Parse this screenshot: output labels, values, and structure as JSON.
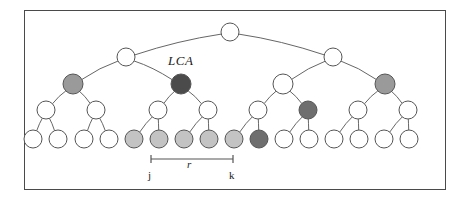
{
  "figure": {
    "frame": {
      "x": 24,
      "y": 10,
      "width": 422,
      "height": 180,
      "border_color": "#4a4a4a"
    }
  },
  "labels": {
    "lca": "LCA",
    "range": "r",
    "left_endpoint": "j",
    "right_endpoint": "k"
  },
  "colors": {
    "outline": "#555555",
    "edge": "#666666",
    "white_node": "#ffffff",
    "light_gray_node": "#c3c3c3",
    "medium_gray_node": "#9a9a9a",
    "dark_gray_node": "#6e6e6e",
    "darkest_node": "#4b4b4b",
    "bracket": "#555555",
    "background": "#ffffff"
  },
  "tree": {
    "levels": [
      {
        "depth": 0,
        "y": 32,
        "radius": 9,
        "nodes": [
          {
            "id": "root",
            "x": 230,
            "fill": "white_node",
            "label": ""
          }
        ]
      },
      {
        "depth": 1,
        "y": 57,
        "radius": 9,
        "nodes": [
          {
            "id": "d1-0",
            "x": 126,
            "fill": "white_node",
            "label": ""
          },
          {
            "id": "d1-1",
            "x": 333,
            "fill": "white_node",
            "label": ""
          }
        ]
      },
      {
        "depth": 2,
        "y": 84,
        "radius": 10,
        "nodes": [
          {
            "id": "d2-0",
            "x": 73,
            "fill": "medium_gray_node",
            "label": ""
          },
          {
            "id": "d2-1",
            "x": 181,
            "fill": "darkest_node",
            "label": "LCA"
          },
          {
            "id": "d2-2",
            "x": 283,
            "fill": "white_node",
            "label": ""
          },
          {
            "id": "d2-3",
            "x": 385,
            "fill": "medium_gray_node",
            "label": ""
          }
        ]
      },
      {
        "depth": 3,
        "y": 110,
        "radius": 9,
        "nodes": [
          {
            "id": "d3-0",
            "x": 46,
            "fill": "white_node",
            "label": ""
          },
          {
            "id": "d3-1",
            "x": 96,
            "fill": "white_node",
            "label": ""
          },
          {
            "id": "d3-2",
            "x": 158,
            "fill": "white_node",
            "label": ""
          },
          {
            "id": "d3-3",
            "x": 208,
            "fill": "white_node",
            "label": ""
          },
          {
            "id": "d3-4",
            "x": 258,
            "fill": "white_node",
            "label": ""
          },
          {
            "id": "d3-5",
            "x": 308,
            "fill": "dark_gray_node",
            "label": ""
          },
          {
            "id": "d3-6",
            "x": 358,
            "fill": "white_node",
            "label": ""
          },
          {
            "id": "d3-7",
            "x": 408,
            "fill": "white_node",
            "label": ""
          }
        ]
      },
      {
        "depth": 4,
        "y": 139,
        "radius": 9,
        "nodes": [
          {
            "id": "leaf-0",
            "x": 33,
            "fill": "white_node",
            "label": ""
          },
          {
            "id": "leaf-1",
            "x": 58,
            "fill": "white_node",
            "label": ""
          },
          {
            "id": "leaf-2",
            "x": 84,
            "fill": "white_node",
            "label": ""
          },
          {
            "id": "leaf-3",
            "x": 109,
            "fill": "white_node",
            "label": ""
          },
          {
            "id": "leaf-4",
            "x": 134,
            "fill": "light_gray_node",
            "label": ""
          },
          {
            "id": "leaf-5",
            "x": 159,
            "fill": "light_gray_node",
            "label": ""
          },
          {
            "id": "leaf-6",
            "x": 184,
            "fill": "light_gray_node",
            "label": ""
          },
          {
            "id": "leaf-7",
            "x": 209,
            "fill": "light_gray_node",
            "label": ""
          },
          {
            "id": "leaf-8",
            "x": 234,
            "fill": "light_gray_node",
            "label": ""
          },
          {
            "id": "leaf-9",
            "x": 259,
            "fill": "dark_gray_node",
            "label": ""
          },
          {
            "id": "leaf-10",
            "x": 284,
            "fill": "white_node",
            "label": ""
          },
          {
            "id": "leaf-11",
            "x": 309,
            "fill": "white_node",
            "label": ""
          },
          {
            "id": "leaf-12",
            "x": 334,
            "fill": "white_node",
            "label": ""
          },
          {
            "id": "leaf-13",
            "x": 359,
            "fill": "white_node",
            "label": ""
          },
          {
            "id": "leaf-14",
            "x": 384,
            "fill": "white_node",
            "label": ""
          },
          {
            "id": "leaf-15",
            "x": 409,
            "fill": "white_node",
            "label": ""
          }
        ]
      }
    ],
    "edges": [
      {
        "from": "root",
        "to": "d1-0"
      },
      {
        "from": "root",
        "to": "d1-1"
      },
      {
        "from": "d1-0",
        "to": "d2-0"
      },
      {
        "from": "d1-0",
        "to": "d2-1"
      },
      {
        "from": "d1-1",
        "to": "d2-2"
      },
      {
        "from": "d1-1",
        "to": "d2-3"
      },
      {
        "from": "d2-0",
        "to": "d3-0"
      },
      {
        "from": "d2-0",
        "to": "d3-1"
      },
      {
        "from": "d2-1",
        "to": "d3-2"
      },
      {
        "from": "d2-1",
        "to": "d3-3"
      },
      {
        "from": "d2-2",
        "to": "d3-4"
      },
      {
        "from": "d2-2",
        "to": "d3-5"
      },
      {
        "from": "d2-3",
        "to": "d3-6"
      },
      {
        "from": "d2-3",
        "to": "d3-7"
      },
      {
        "from": "d3-0",
        "to": "leaf-0"
      },
      {
        "from": "d3-0",
        "to": "leaf-1"
      },
      {
        "from": "d3-1",
        "to": "leaf-2"
      },
      {
        "from": "d3-1",
        "to": "leaf-3"
      },
      {
        "from": "d3-2",
        "to": "leaf-4"
      },
      {
        "from": "d3-2",
        "to": "leaf-5"
      },
      {
        "from": "d3-3",
        "to": "leaf-6"
      },
      {
        "from": "d3-3",
        "to": "leaf-7"
      },
      {
        "from": "d3-4",
        "to": "leaf-8"
      },
      {
        "from": "d3-4",
        "to": "leaf-9"
      },
      {
        "from": "d3-5",
        "to": "leaf-10"
      },
      {
        "from": "d3-5",
        "to": "leaf-11"
      },
      {
        "from": "d3-6",
        "to": "leaf-12"
      },
      {
        "from": "d3-6",
        "to": "leaf-13"
      },
      {
        "from": "d3-7",
        "to": "leaf-14"
      },
      {
        "from": "d3-7",
        "to": "leaf-15"
      }
    ],
    "range_bracket": {
      "y": 159,
      "x_start": 151,
      "x_end": 233,
      "tick_height": 8
    }
  }
}
